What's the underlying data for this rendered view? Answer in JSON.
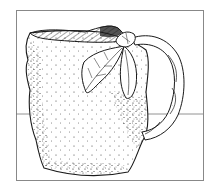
{
  "image": {
    "title": "Pen-and-ink illustration of a textured ceramic pitcher with leaves on the handle",
    "subject": "pitcher",
    "elements": [
      "frame",
      "table-line",
      "pitcher-body",
      "pitcher-rim",
      "handle",
      "leaves",
      "stipple-texture"
    ],
    "colors": {
      "background": "#ffffff",
      "ink": "#1a1a1a",
      "frame": "#888888",
      "table_line": "#777777"
    }
  }
}
